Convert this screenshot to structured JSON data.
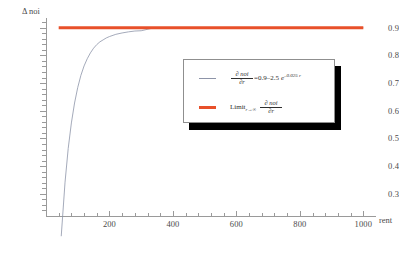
{
  "chart_data": {
    "type": "line",
    "title": "",
    "xlabel": "rent",
    "ylabel": "Δ noi",
    "xlim": [
      0,
      1040
    ],
    "ylim": [
      0.22,
      0.935
    ],
    "grid": false,
    "legend_position": "center-right",
    "x_ticks": [
      200,
      400,
      600,
      800,
      1000
    ],
    "x_tick_labels": [
      "200",
      "400",
      "600",
      "800",
      "1000"
    ],
    "x_minor_step": 40,
    "y_ticks": [
      0.3,
      0.4,
      0.5,
      0.6,
      0.7,
      0.8,
      0.9
    ],
    "y_tick_labels": [
      "0.3",
      "0.4",
      "0.5",
      "0.6",
      "0.7",
      "0.8",
      "0.9"
    ],
    "y_minor_step": 0.02,
    "series": [
      {
        "name": "partial-derivative-curve",
        "color": "#8d94a8",
        "width": 0.8,
        "formula": "dnoi/dr = 0.9 - 2.5 e^(-0.025 r)",
        "x": [
          48,
          60,
          70,
          80,
          90,
          100,
          110,
          120,
          130,
          140,
          150,
          160,
          170,
          180,
          190,
          200,
          220,
          240,
          260,
          280,
          300,
          340,
          400,
          500,
          600,
          700,
          800,
          900,
          1000
        ],
        "values": [
          0.147,
          0.342,
          0.464,
          0.556,
          0.628,
          0.684,
          0.728,
          0.762,
          0.788,
          0.809,
          0.826,
          0.839,
          0.849,
          0.856,
          0.863,
          0.868,
          0.876,
          0.881,
          0.885,
          0.888,
          0.889,
          0.8995,
          0.8997,
          0.8999,
          0.9,
          0.9,
          0.9,
          0.9,
          0.9
        ]
      },
      {
        "name": "limit-line",
        "color": "#e8502a",
        "width": 3,
        "formula": "Limit r->inf dnoi/dr",
        "x": [
          40,
          1000
        ],
        "values": [
          0.9,
          0.9
        ]
      }
    ]
  },
  "legend": {
    "entries": [
      {
        "swatch": "thin-gray-line",
        "numerator": "∂ noi",
        "denominator": "∂r",
        "equals": "=0.9–2.5",
        "exp_base": "e",
        "exp_power": "–0.025 r"
      },
      {
        "swatch": "thick-red-line",
        "limit_word": "Limit",
        "limit_sub": "r→∞",
        "numerator": "∂ noi",
        "denominator": "∂r"
      }
    ]
  },
  "caption": {
    "text": ""
  }
}
